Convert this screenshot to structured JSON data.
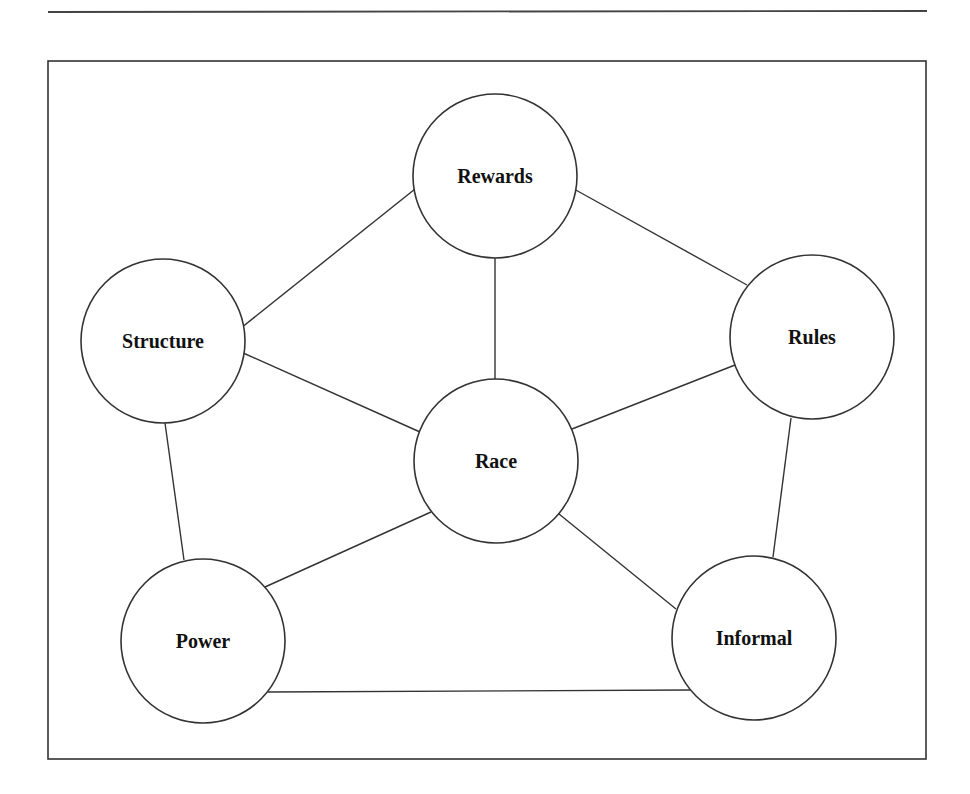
{
  "diagram": {
    "type": "network",
    "colors": {
      "stroke": "#333333",
      "text": "#111111",
      "background": "#ffffff"
    },
    "nodes": [
      {
        "id": "rewards",
        "label": "Rewards",
        "cx": 495,
        "cy": 176,
        "r": 82
      },
      {
        "id": "structure",
        "label": "Structure",
        "cx": 163,
        "cy": 341,
        "r": 82
      },
      {
        "id": "rules",
        "label": "Rules",
        "cx": 812,
        "cy": 337,
        "r": 82
      },
      {
        "id": "race",
        "label": "Race",
        "cx": 496,
        "cy": 461,
        "r": 82
      },
      {
        "id": "power",
        "label": "Power",
        "cx": 203,
        "cy": 641,
        "r": 82
      },
      {
        "id": "informal",
        "label": "Informal",
        "cx": 754,
        "cy": 638,
        "r": 82
      }
    ],
    "edges": [
      {
        "from": "structure",
        "to": "rewards",
        "x1": 241,
        "y1": 328,
        "x2": 415,
        "y2": 189
      },
      {
        "from": "rewards",
        "to": "rules",
        "x1": 574,
        "y1": 189,
        "x2": 747,
        "y2": 285
      },
      {
        "from": "rewards",
        "to": "race",
        "x1": 495,
        "y1": 258,
        "x2": 495,
        "y2": 379
      },
      {
        "from": "structure",
        "to": "race",
        "x1": 241,
        "y1": 352,
        "x2": 420,
        "y2": 432
      },
      {
        "from": "race",
        "to": "rules",
        "x1": 572,
        "y1": 429,
        "x2": 735,
        "y2": 365
      },
      {
        "from": "structure",
        "to": "power",
        "x1": 165,
        "y1": 423,
        "x2": 184,
        "y2": 560
      },
      {
        "from": "rules",
        "to": "informal",
        "x1": 791,
        "y1": 418,
        "x2": 773,
        "y2": 557
      },
      {
        "from": "race",
        "to": "power",
        "x1": 431,
        "y1": 512,
        "x2": 265,
        "y2": 587
      },
      {
        "from": "race",
        "to": "informal",
        "x1": 559,
        "y1": 514,
        "x2": 676,
        "y2": 609
      },
      {
        "from": "power",
        "to": "informal",
        "x1": 268,
        "y1": 692,
        "x2": 690,
        "y2": 690
      }
    ]
  }
}
